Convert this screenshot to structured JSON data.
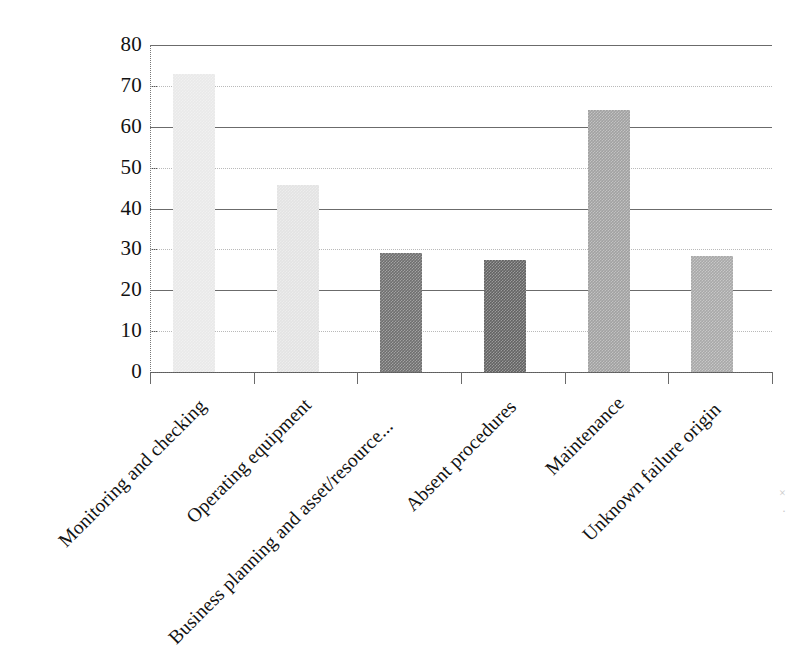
{
  "chart_data": {
    "type": "bar",
    "title": "",
    "subtitle": "",
    "xlabel": "",
    "ylabel": "",
    "ylim": [
      0,
      80
    ],
    "ytick_step": 10,
    "yticks": [
      "80",
      "70",
      "60",
      "50",
      "40",
      "30",
      "20",
      "10",
      "0"
    ],
    "grid": true,
    "grid_axis": "y",
    "legend": "none",
    "categories": [
      "Monitoring and checking",
      "Operating equipment",
      "Business planning and asset/resource...",
      "Absent procedures",
      "Maintenance",
      "Unknown failure origin"
    ],
    "values": [
      73,
      45.7,
      29,
      27.5,
      64,
      28.3
    ],
    "bar_colors": [
      "#e9e9e9",
      "#e3e3e3",
      "#6f6f6f",
      "#636363",
      "#a1a1a1",
      "#a8a8a8"
    ],
    "xtick_label_rotation": -45
  },
  "axes": {
    "y_axis_name": "y-axis",
    "x_axis_name": "x-axis"
  },
  "marks": {
    "speck_1": "·",
    "speck_2": "×"
  }
}
